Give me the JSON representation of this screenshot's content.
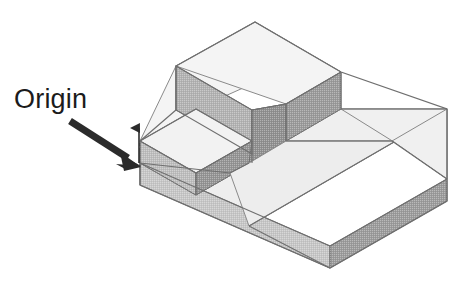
{
  "figure": {
    "kind": "isometric-technical-drawing",
    "background_color": "#ffffff",
    "annotations": [
      {
        "name": "origin",
        "label": "Origin",
        "label_color": "#1b1b1b",
        "label_font_size_px": 27,
        "label_position": {
          "x": 14,
          "y": 84
        },
        "leader": {
          "type": "arrow",
          "color": "#2b2b2b",
          "tail": {
            "x": 70,
            "y": 121
          },
          "head": {
            "x": 141,
            "y": 166
          },
          "shaft_width_px": 7,
          "head_length_px": 22,
          "head_width_px": 19
        },
        "hidden_edge_marker": {
          "type": "dashed-vertical-line",
          "color": "#ffffff",
          "x": 138,
          "y_top": 116,
          "y_bottom": 148,
          "dash": "3 3",
          "width_px": 3
        },
        "vertical_tick": {
          "type": "arrow-up",
          "color": "#2b2b2b",
          "x": 139,
          "y_top": 128,
          "y_bottom": 163
        }
      }
    ],
    "palette": {
      "top_light": "#f1f1f1",
      "top_light_alt": "#ececec",
      "face_mid": "#bdbdbd",
      "face_mid_2": "#b2b2b2",
      "face_dark": "#949494",
      "face_dark_2": "#8c8c8c",
      "face_base_front": "#c6c6c6",
      "face_base_right": "#9b9b9b",
      "outline": "#6f6f6f",
      "outline_soft": "#8a8a8a"
    },
    "geometry_note": "Isometric projection; ~30 degree axes. Base slab with an L-shaped raised portion and a tall block at the rear-left, creating two step levels.",
    "faces": [
      {
        "name": "base-top-left-wing",
        "tone": "top_light"
      },
      {
        "name": "base-top-front-channel",
        "tone": "top_light"
      },
      {
        "name": "base-front-left-face",
        "tone": "face_base_front"
      },
      {
        "name": "base-front-right-face",
        "tone": "face_base_right"
      },
      {
        "name": "low-step-top",
        "tone": "top_light"
      },
      {
        "name": "low-step-left-face",
        "tone": "face_mid"
      },
      {
        "name": "low-step-front-face",
        "tone": "face_dark"
      },
      {
        "name": "tall-block-top",
        "tone": "top_light"
      },
      {
        "name": "tall-block-left-face",
        "tone": "face_mid_2"
      },
      {
        "name": "tall-block-front-face",
        "tone": "face_dark_2"
      },
      {
        "name": "right-rail-top",
        "tone": "top_light"
      },
      {
        "name": "right-rail-end-face",
        "tone": "face_dark"
      },
      {
        "name": "right-step-top",
        "tone": "top_light"
      },
      {
        "name": "right-step-end-face",
        "tone": "face_base_right"
      }
    ]
  }
}
